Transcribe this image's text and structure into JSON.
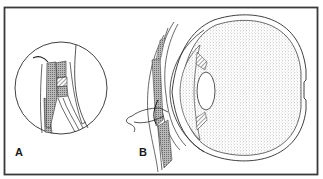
{
  "figure": {
    "panels": [
      {
        "id": "A",
        "label": "A",
        "content": "magnified inset of eyelid tissue layers"
      },
      {
        "id": "B",
        "label": "B",
        "content": "cross-section of eyeball with eyelid and suture needle"
      }
    ],
    "colors": {
      "frame": "#3a3a3a",
      "line": "#2a2a2a",
      "stipple": "#9a9a9a",
      "background": "#ffffff"
    }
  }
}
